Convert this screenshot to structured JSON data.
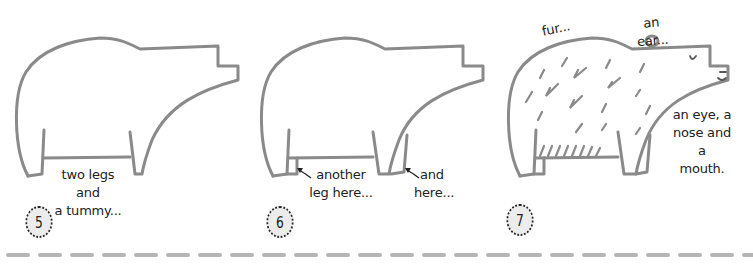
{
  "steps": [
    {
      "number": "5",
      "captions": [
        "two legs and\na tummy..."
      ]
    },
    {
      "number": "6",
      "captions": [
        "another\nleg here...",
        "and\nhere..."
      ]
    },
    {
      "number": "7",
      "captions": [
        "fur...",
        "an ear...",
        "an eye, a\nnose and a\nmouth."
      ]
    }
  ],
  "colors": {
    "line": "#8a8a8a",
    "badge_bg": "#ececec",
    "text": "#222222",
    "divider": "#b5b5b5"
  }
}
